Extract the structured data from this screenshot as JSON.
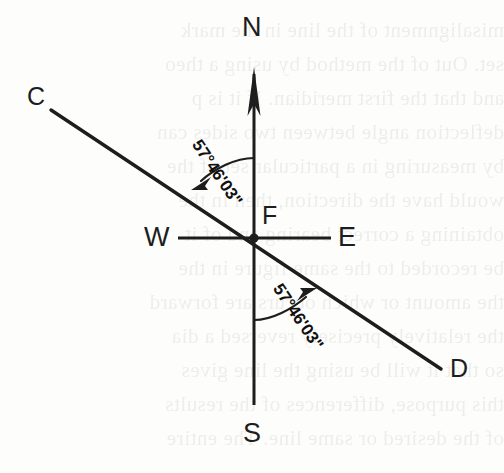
{
  "figure": {
    "kind": "surveying-bearing-diagram",
    "ink_color": "#1d1d1d",
    "paper_color": "#fdfdfb"
  },
  "compass": {
    "north_label": "N",
    "south_label": "S",
    "east_label": "E",
    "west_label": "W"
  },
  "points": {
    "origin_label": "F",
    "line_start_label": "C",
    "line_end_label": "D"
  },
  "angles": {
    "upper_bearing": "57°46'03\"",
    "lower_bearing": "57°46'03\""
  },
  "bleed_text": [
    "misalignment of the line in the mark",
    "set. Out of the method by using a theo",
    "and that the first meridian. If it is p",
    "deflection angle between two sides can",
    "by measuring in a particular set of the",
    "would have the direction, then in the",
    "obtaining a correct bearing and of it",
    "be recorded to the same figure in the",
    "the amount or which occurs are forward",
    "the relatively precisely reversed a dia",
    "so that it will be using the line gives",
    "this purpose, differences of the results",
    "of the desired or same line. The entire"
  ]
}
